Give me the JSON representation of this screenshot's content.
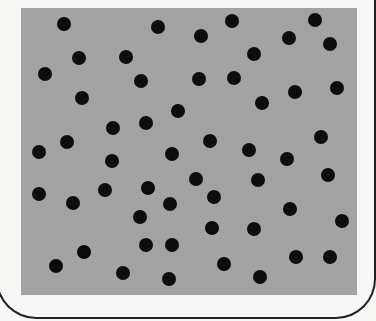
{
  "figure": {
    "field_color": "#a3a3a3",
    "dot_color": "#0d0d0d",
    "dot_count": 52,
    "dots": [
      [
        64,
        24
      ],
      [
        158,
        27
      ],
      [
        232,
        21
      ],
      [
        315,
        20
      ],
      [
        201,
        36
      ],
      [
        289,
        38
      ],
      [
        330,
        44
      ],
      [
        79,
        58
      ],
      [
        126,
        57
      ],
      [
        254,
        54
      ],
      [
        45,
        74
      ],
      [
        141,
        81
      ],
      [
        199,
        79
      ],
      [
        234,
        78
      ],
      [
        337,
        88
      ],
      [
        82,
        98
      ],
      [
        295,
        92
      ],
      [
        262,
        103
      ],
      [
        178,
        111
      ],
      [
        113,
        128
      ],
      [
        146,
        123
      ],
      [
        321,
        137
      ],
      [
        67,
        142
      ],
      [
        210,
        141
      ],
      [
        39,
        152
      ],
      [
        172,
        154
      ],
      [
        249,
        150
      ],
      [
        287,
        159
      ],
      [
        112,
        161
      ],
      [
        328,
        175
      ],
      [
        196,
        179
      ],
      [
        258,
        180
      ],
      [
        105,
        190
      ],
      [
        148,
        188
      ],
      [
        39,
        194
      ],
      [
        73,
        203
      ],
      [
        214,
        197
      ],
      [
        170,
        204
      ],
      [
        290,
        209
      ],
      [
        140,
        217
      ],
      [
        342,
        221
      ],
      [
        212,
        228
      ],
      [
        254,
        229
      ],
      [
        146,
        245
      ],
      [
        172,
        245
      ],
      [
        84,
        252
      ],
      [
        296,
        257
      ],
      [
        330,
        257
      ],
      [
        56,
        266
      ],
      [
        123,
        273
      ],
      [
        224,
        264
      ],
      [
        169,
        279
      ],
      [
        260,
        277
      ]
    ]
  }
}
